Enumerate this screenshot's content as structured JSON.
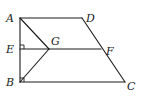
{
  "figure": {
    "type": "geometry-diagram",
    "width": 144,
    "height": 96,
    "stroke_color": "#1a1a1a",
    "background": "#ffffff"
  },
  "points": {
    "A": {
      "label": "A",
      "x": 20,
      "y": 18,
      "label_x": 6,
      "label_y": 22
    },
    "D": {
      "label": "D",
      "x": 82,
      "y": 18,
      "label_x": 86,
      "label_y": 22
    },
    "E": {
      "label": "E",
      "x": 20,
      "y": 49,
      "label_x": 6,
      "label_y": 53
    },
    "G": {
      "label": "G",
      "x": 49,
      "y": 49,
      "label_x": 51,
      "label_y": 45
    },
    "F": {
      "label": "F",
      "x": 101,
      "y": 49,
      "label_x": 106,
      "label_y": 55
    },
    "B": {
      "label": "B",
      "x": 20,
      "y": 82,
      "label_x": 6,
      "label_y": 86
    },
    "C": {
      "label": "C",
      "x": 125,
      "y": 82,
      "label_x": 127,
      "label_y": 90
    }
  },
  "segments": [
    {
      "from": "A",
      "to": "D"
    },
    {
      "from": "A",
      "to": "B"
    },
    {
      "from": "B",
      "to": "C"
    },
    {
      "from": "D",
      "to": "C"
    },
    {
      "from": "E",
      "to": "F"
    },
    {
      "from": "A",
      "to": "G"
    },
    {
      "from": "G",
      "to": "B"
    }
  ],
  "right_angles": [
    {
      "at": "E",
      "description": "AB perpendicular to EF"
    },
    {
      "at": "B",
      "description": "AB perpendicular to BC"
    }
  ]
}
